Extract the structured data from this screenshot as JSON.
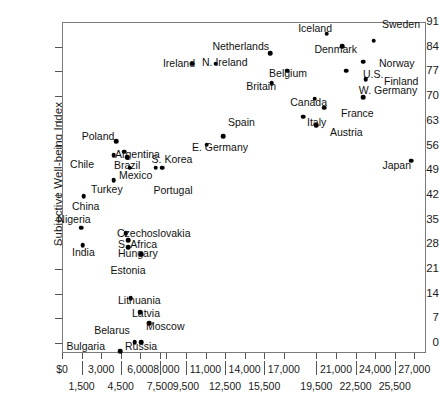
{
  "chart_data": {
    "type": "scatter",
    "title": "",
    "xlabel": "",
    "ylabel": "Subjective Well-being Index",
    "xlim": [
      0,
      27900
    ],
    "ylim": [
      -2.8,
      91
    ],
    "grid": false,
    "legend": "none",
    "y_ticks": [
      0,
      7,
      14,
      21,
      28,
      35,
      42,
      49,
      56,
      63,
      70,
      77,
      84,
      91
    ],
    "x_ticks": [
      "$0",
      "1,500",
      "3,000",
      "4,500",
      "6,000",
      "7,500",
      "8,000",
      "9,500",
      "11,000",
      "12,500",
      "14,000",
      "15,500",
      "17,000",
      "19,500",
      "21,000",
      "22,500",
      "24,000",
      "25,500",
      "27,000"
    ],
    "x_tick_values": [
      0,
      1500,
      3000,
      4500,
      6000,
      7500,
      8000,
      9500,
      11000,
      12500,
      14000,
      15500,
      17000,
      19500,
      21000,
      22500,
      24000,
      25500,
      27000
    ],
    "points": [
      {
        "label": "Iceland",
        "x": 20200,
        "y": 88.0,
        "lx": 331,
        "ly": 27,
        "lpos": "lbl-left"
      },
      {
        "label": "Sweden",
        "x": 23800,
        "y": 86.0,
        "lx": 400,
        "ly": 28,
        "lpos": "lbl-above"
      },
      {
        "label": "Denmark",
        "x": 21400,
        "y": 84.5,
        "lx": 356,
        "ly": 48,
        "lpos": "lbl-left"
      },
      {
        "label": "Netherlands",
        "x": 15900,
        "y": 82.5,
        "lx": 268,
        "ly": 45,
        "lpos": "lbl-left"
      },
      {
        "label": "Norway",
        "x": 23000,
        "y": 80.0,
        "lx": 378,
        "ly": 62,
        "lpos": "lbl-right"
      },
      {
        "label": "N. Ireland",
        "x": 11700,
        "y": 79.5,
        "lx": 201,
        "ly": 61,
        "lpos": "lbl-right"
      },
      {
        "label": "Ireland",
        "x": 9900,
        "y": 79.5,
        "lx": 194,
        "ly": 62,
        "lpos": "lbl-left"
      },
      {
        "label": "Belgium",
        "x": 17200,
        "y": 77.5,
        "lx": 306,
        "ly": 72,
        "lpos": "lbl-left"
      },
      {
        "label": "U.S.",
        "x": 21700,
        "y": 77.5,
        "lx": 362,
        "ly": 73,
        "lpos": "lbl-right"
      },
      {
        "label": "Finland",
        "x": 23200,
        "y": 75.0,
        "lx": 383,
        "ly": 80,
        "lpos": "lbl-right"
      },
      {
        "label": "Britain",
        "x": 16000,
        "y": 74.0,
        "lx": 275,
        "ly": 85,
        "lpos": "lbl-left"
      },
      {
        "label": "W. Germany",
        "x": 23000,
        "y": 70.0,
        "lx": 387,
        "ly": 94,
        "lpos": "lbl-above"
      },
      {
        "label": "Canada",
        "x": 19300,
        "y": 69.5,
        "lx": 326,
        "ly": 101,
        "lpos": "lbl-left"
      },
      {
        "label": "France",
        "x": 20000,
        "y": 67.0,
        "lx": 340,
        "ly": 112,
        "lpos": "lbl-right"
      },
      {
        "label": "Italy",
        "x": 18400,
        "y": 64.5,
        "lx": 306,
        "ly": 121,
        "lpos": "lbl-right"
      },
      {
        "label": "Austria",
        "x": 19400,
        "y": 62.0,
        "lx": 329,
        "ly": 131,
        "lpos": "lbl-right"
      },
      {
        "label": "Spain",
        "x": 12300,
        "y": 59.0,
        "lx": 227,
        "ly": 121,
        "lpos": "lbl-right"
      },
      {
        "label": "E. Germany",
        "x": 11000,
        "y": 56.5,
        "lx": 191,
        "ly": 146,
        "lpos": "lbl-right"
      },
      {
        "label": "Poland",
        "x": 4100,
        "y": 57.5,
        "lx": 97,
        "ly": 140,
        "lpos": "lbl-above"
      },
      {
        "label": "Argentina",
        "x": 4700,
        "y": 54.5,
        "lx": 114,
        "ly": 153,
        "lpos": "lbl-right"
      },
      {
        "label": "Chile",
        "x": 3900,
        "y": 53.5,
        "lx": 93,
        "ly": 163,
        "lpos": "lbl-left"
      },
      {
        "label": "Brazil",
        "x": 4900,
        "y": 53.0,
        "lx": 113,
        "ly": 164,
        "lpos": "lbl-right"
      },
      {
        "label": "Mexico",
        "x": 5100,
        "y": 50.0,
        "lx": 118,
        "ly": 174,
        "lpos": "lbl-right"
      },
      {
        "label": "S. Korea",
        "x": 7100,
        "y": 50.0,
        "lx": 171,
        "ly": 163,
        "lpos": "lbl-above"
      },
      {
        "label": "Portugal",
        "x": 7600,
        "y": 50.0,
        "lx": 172,
        "ly": 184,
        "lpos": "lbl-below"
      },
      {
        "label": "Turkey",
        "x": 3900,
        "y": 46.5,
        "lx": 90,
        "ly": 188,
        "lpos": "lbl-right"
      },
      {
        "label": "Japan",
        "x": 26700,
        "y": 52.0,
        "lx": 410,
        "ly": 164,
        "lpos": "lbl-left"
      },
      {
        "label": "China",
        "x": 1600,
        "y": 42.0,
        "lx": 71,
        "ly": 205,
        "lpos": "lbl-right"
      },
      {
        "label": "Nigeria",
        "x": 1400,
        "y": 33.0,
        "lx": 73,
        "ly": 223,
        "lpos": "lbl-above"
      },
      {
        "label": "Czechoslovakia",
        "x": 4800,
        "y": 31.5,
        "lx": 116,
        "ly": 232,
        "lpos": "lbl-right"
      },
      {
        "label": "S. Africa",
        "x": 5000,
        "y": 29.5,
        "lx": 117,
        "ly": 243,
        "lpos": "lbl-right"
      },
      {
        "label": "India",
        "x": 1500,
        "y": 28.0,
        "lx": 71,
        "ly": 251,
        "lpos": "lbl-right"
      },
      {
        "label": "Hungary",
        "x": 5000,
        "y": 27.5,
        "lx": 117,
        "ly": 252,
        "lpos": "lbl-right"
      },
      {
        "label": "Estonia",
        "x": 6000,
        "y": 25.5,
        "lx": 127,
        "ly": 264,
        "lpos": "lbl-below"
      },
      {
        "label": "Lithuania",
        "x": 5200,
        "y": 13.0,
        "lx": 117,
        "ly": 299,
        "lpos": "lbl-right"
      },
      {
        "label": "Latvia",
        "x": 5900,
        "y": 9.0,
        "lx": 131,
        "ly": 312,
        "lpos": "lbl-right"
      },
      {
        "label": "Moscow",
        "x": 6600,
        "y": 6.0,
        "lx": 145,
        "ly": 325,
        "lpos": "lbl-right"
      },
      {
        "label": "Belarus",
        "x": 5500,
        "y": 0.5,
        "lx": 111,
        "ly": 334,
        "lpos": "lbl-above"
      },
      {
        "label": "Russia",
        "x": 6000,
        "y": 0.5,
        "lx": 124,
        "ly": 345,
        "lpos": "lbl-right"
      },
      {
        "label": "Bulgaria",
        "x": 4400,
        "y": -2.0,
        "lx": 104,
        "ly": 345,
        "lpos": "lbl-left"
      }
    ]
  }
}
